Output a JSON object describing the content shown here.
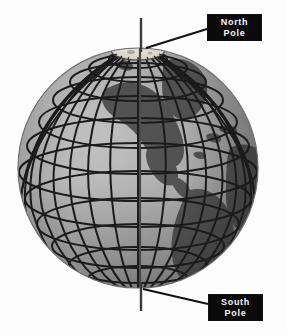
{
  "figure": {
    "background_color": "#fdfdfd",
    "width": 287,
    "height": 335
  },
  "globe": {
    "center_x": 138,
    "center_y": 168,
    "radius": 120,
    "ocean_color_light": "#b9b9b9",
    "ocean_color_mid": "#a3a3a3",
    "ocean_color_dark": "#8a8a8a",
    "land_color": "#565656",
    "grid_color": "#1a1a1a",
    "grid_line_width": 2.0,
    "icecap_color": "#dedad4",
    "axis_color": "#3a3a3a",
    "latitude_count": 11,
    "longitude_count": 24,
    "icecap_label": "north-polar-ice-cap"
  },
  "axis": {
    "label": "rotation-axis",
    "top_y": 18,
    "bottom_y": 311,
    "x": 141
  },
  "callouts": [
    {
      "id": "north-pole",
      "line1": "North",
      "line2": "Pole",
      "box_color": "#0a0a0a",
      "text_color": "#f7f7f7",
      "pointer_from_x": 207,
      "pointer_from_y": 30,
      "pointer_to_x": 147,
      "pointer_to_y": 47
    },
    {
      "id": "south-pole",
      "line1": "South",
      "line2": "Pole",
      "box_color": "#0a0a0a",
      "text_color": "#f7f7f7",
      "pointer_from_x": 208,
      "pointer_from_y": 303,
      "pointer_to_x": 143,
      "pointer_to_y": 290
    }
  ],
  "landmasses": [
    {
      "name": "greenland-north-america",
      "color": "#565656"
    },
    {
      "name": "africa-eurasia-edge",
      "color": "#565656"
    },
    {
      "name": "south-america",
      "color": "#565656"
    }
  ]
}
